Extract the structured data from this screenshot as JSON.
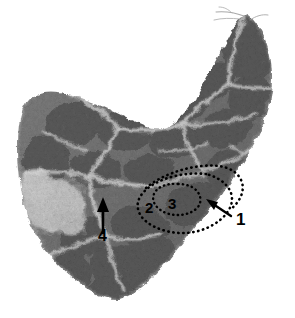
{
  "figure": {
    "kind": "histology-micrograph",
    "modality": "light-microscopy",
    "stain": "hematoxylin-eosin",
    "color_mode": "grayscale",
    "background_color": "#ffffff",
    "tissue_mid_gray": "#6f6f6f",
    "tissue_dark_gray": "#4a4a4a",
    "septa_light_gray": "#c9c9c9",
    "pale_zone_gray": "#d8d8d8",
    "annotation_color": "#000000",
    "width": 295,
    "height": 318
  },
  "annotations": {
    "labels": [
      {
        "id": "1",
        "text": "1",
        "x": 236,
        "y": 219,
        "marker": "arrow",
        "points_to": "outer-dotted-boundary"
      },
      {
        "id": "2",
        "text": "2",
        "x": 145,
        "y": 200,
        "marker": "none",
        "points_to": "outer-dotted-region"
      },
      {
        "id": "3",
        "text": "3",
        "x": 168,
        "y": 197,
        "marker": "none",
        "points_to": "inner-dotted-region"
      },
      {
        "id": "4",
        "text": "4",
        "x": 101,
        "y": 228,
        "marker": "arrow",
        "points_to": "pale-septum"
      }
    ],
    "arrows": [
      {
        "id": "arrow-1",
        "from_x": 232,
        "from_y": 216,
        "to_x": 208,
        "to_y": 200,
        "direction": "up-left"
      },
      {
        "id": "arrow-4",
        "from_x": 103,
        "from_y": 234,
        "to_x": 103,
        "to_y": 199,
        "direction": "up"
      }
    ],
    "dotted_regions": [
      {
        "id": "outer-dotted-region",
        "label": "2",
        "style": "dotted-outline",
        "shape": "elongated-oval"
      },
      {
        "id": "inner-dotted-region",
        "label": "3",
        "style": "dotted-outline",
        "shape": "small-oval"
      }
    ]
  }
}
